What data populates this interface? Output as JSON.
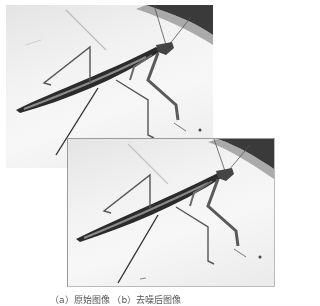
{
  "figure": {
    "photos": [
      {
        "subject": "praying mantis",
        "tone": "grayscale"
      },
      {
        "subject": "praying mantis",
        "tone": "grayscale"
      }
    ],
    "caption": "（a）原始图像 （b）去噪后图像"
  },
  "colors": {
    "background": "#ffffff",
    "corner_shadow": "#3a3a3a",
    "insect_dark": "#2b2b2b",
    "insect_mid": "#777777"
  }
}
